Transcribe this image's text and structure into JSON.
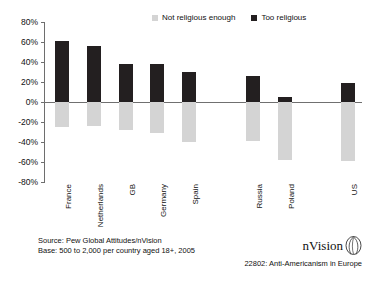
{
  "chart_data": {
    "type": "bar",
    "title": "",
    "xlabel": "",
    "ylabel": "",
    "ylim": [
      -80,
      80
    ],
    "ytick_step": 20,
    "yticks": [
      "80%",
      "60%",
      "40%",
      "20%",
      "0%",
      "-20%",
      "-40%",
      "-60%",
      "-80%"
    ],
    "grid": false,
    "legend_position": "top",
    "categories": [
      "France",
      "Netherlands",
      "GB",
      "Germany",
      "Spain",
      "",
      "Russia",
      "Poland",
      "",
      "US"
    ],
    "series": [
      {
        "name": "Too religious",
        "color": "#231f20",
        "values": [
          61,
          56,
          38,
          38,
          30,
          null,
          26,
          5,
          null,
          19
        ]
      },
      {
        "name": "Not religious enough",
        "color": "#d4d4d4",
        "values": [
          -25,
          -24,
          -28,
          -31,
          -40,
          null,
          -39,
          -58,
          null,
          -59
        ]
      }
    ]
  },
  "legend": {
    "entries": [
      {
        "label": "Not religious enough",
        "color": "#d4d4d4"
      },
      {
        "label": "Too religious",
        "color": "#231f20"
      }
    ]
  },
  "footer": {
    "source": "Source: Pew Global Attitudes/nVision",
    "base": "Base: 500 to 2,000 per country aged 18+, 2005"
  },
  "brand": {
    "name": "nVision",
    "caption": "22802: Anti-Americanism in Europe"
  }
}
